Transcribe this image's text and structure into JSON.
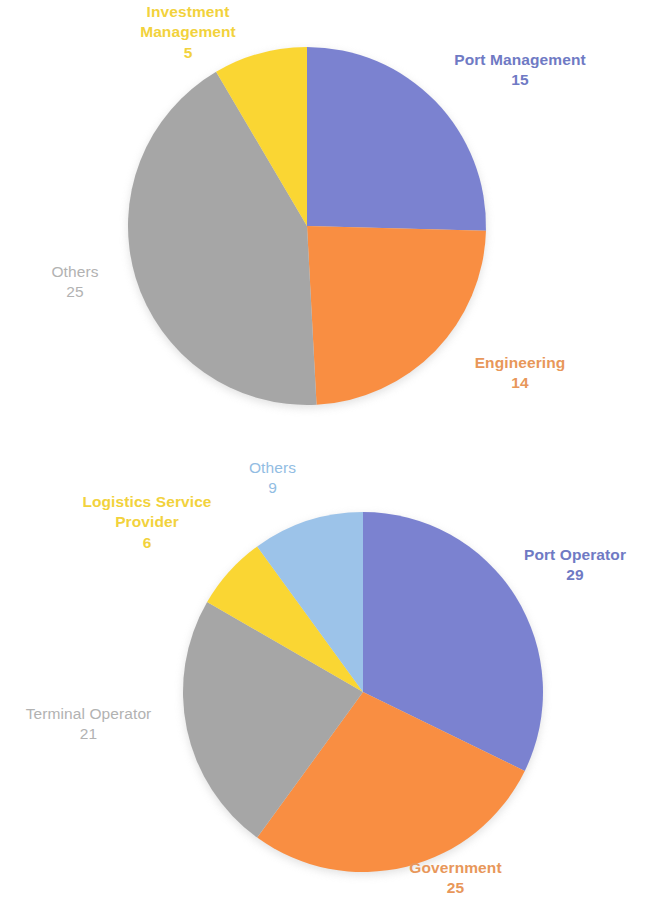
{
  "page": {
    "background": "#ffffff",
    "width": 653,
    "height": 911
  },
  "palette": {
    "blue": "#7b82d0",
    "orange": "#f98e42",
    "gray": "#a6a6a6",
    "yellow": "#fad633",
    "light_blue": "#9cc3e9",
    "label_blue": "#6f7ac4",
    "label_orange": "#e8975a",
    "label_gray": "#b2b2b2",
    "label_yellow": "#f2d23c",
    "label_light_blue": "#92bde3"
  },
  "chart_data": [
    {
      "id": "top",
      "type": "pie",
      "title": "",
      "start_angle": 0,
      "direction": "clockwise",
      "total": 59,
      "categories": [
        "Port Management",
        "Engineering",
        "Others",
        "Investment Management"
      ],
      "values": [
        15,
        14,
        25,
        5
      ],
      "slices": [
        {
          "label": "Port Management",
          "value": 15,
          "color": "#7b82d0",
          "label_color": "#6f7ac4"
        },
        {
          "label": "Engineering",
          "value": 14,
          "color": "#f98e42",
          "label_color": "#e8975a"
        },
        {
          "label": "Others",
          "value": 25,
          "color": "#a6a6a6",
          "label_color": "#b2b2b2"
        },
        {
          "label": "Investment Management",
          "value": 5,
          "color": "#fad633",
          "label_color": "#f2d23c"
        }
      ],
      "geometry": {
        "cx": 307,
        "cy": 226,
        "r": 179
      },
      "legend": "none",
      "grid": false
    },
    {
      "id": "bottom",
      "type": "pie",
      "title": "",
      "start_angle": 0,
      "direction": "clockwise",
      "total": 90,
      "categories": [
        "Port Operator",
        "Government",
        "Terminal Operator",
        "Logistics Service Provider",
        "Others"
      ],
      "values": [
        29,
        25,
        21,
        6,
        9
      ],
      "slices": [
        {
          "label": "Port Operator",
          "value": 29,
          "color": "#7b82d0",
          "label_color": "#6f7ac4"
        },
        {
          "label": "Government",
          "value": 25,
          "color": "#f98e42",
          "label_color": "#e8975a"
        },
        {
          "label": "Terminal Operator",
          "value": 21,
          "color": "#a6a6a6",
          "label_color": "#b2b2b2"
        },
        {
          "label": "Logistics Service Provider",
          "value": 6,
          "color": "#fad633",
          "label_color": "#f2d23c"
        },
        {
          "label": "Others",
          "value": 9,
          "color": "#9cc3e9",
          "label_color": "#92bde3"
        }
      ],
      "geometry": {
        "cx": 363,
        "cy": 692,
        "r": 180
      },
      "legend": "none",
      "grid": false
    }
  ],
  "labels": {
    "top": {
      "investment_management": {
        "name": "Investment\nManagement",
        "line1": "Investment",
        "line2": "Management",
        "value": "5"
      },
      "port_management": {
        "name": "Port Management",
        "value": "15"
      },
      "engineering": {
        "name": "Engineering",
        "value": "14"
      },
      "others": {
        "name": "Others",
        "value": "25"
      }
    },
    "bottom": {
      "others": {
        "name": "Others",
        "value": "9"
      },
      "logistics_service_provider": {
        "line1": "Logistics Service",
        "line2": "Provider",
        "value": "6"
      },
      "port_operator": {
        "name": "Port Operator",
        "value": "29"
      },
      "terminal_operator": {
        "name": "Terminal Operator",
        "value": "21"
      },
      "government": {
        "name": "Government",
        "value": "25"
      }
    }
  }
}
